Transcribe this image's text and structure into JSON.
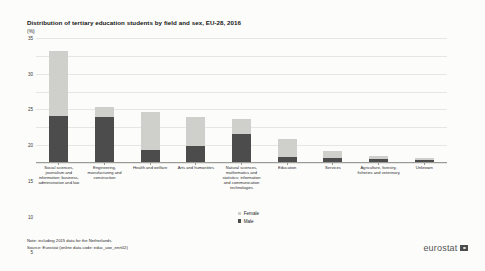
{
  "header": {
    "title": "Distribution of tertiary education students by field and sex, EU-28, 2016",
    "unit": "(%)"
  },
  "legend": {
    "female_label": "Female",
    "male_label": "Male"
  },
  "footer": {
    "note": "Note: including 2015 data for the Netherlands.",
    "source": "Source: Eurostat (online data code: educ_uoe_enrt02)",
    "brand": "eurostat"
  },
  "colors": {
    "female": "#cfcfcc",
    "male": "#4c4c4c",
    "grid": "#e6e6e3",
    "axis": "#9a9a97",
    "background": "#fcfcfb"
  },
  "chart_data": {
    "type": "bar",
    "title": "Distribution of tertiary education students by field and sex, EU-28, 2016",
    "xlabel": "",
    "ylabel": "(%)",
    "ylim": [
      0,
      35
    ],
    "yticks": [
      0,
      5,
      10,
      15,
      20,
      25,
      30,
      35
    ],
    "grid": true,
    "stacked": true,
    "legend_position": "bottom-center",
    "categories": [
      "Social sciences, journalism and information; business, administration and law",
      "Engineering, manufacturing and construction",
      "Health and welfare",
      "Arts and humanities",
      "Natural sciences, mathematics and statistics; information and communication technologies",
      "Education",
      "Services",
      "Agriculture, forestry, fisheries and veterinary",
      "Unknown"
    ],
    "series": [
      {
        "name": "Male",
        "values": [
          13.0,
          12.5,
          3.3,
          4.6,
          7.8,
          1.4,
          1.2,
          0.8,
          0.5
        ]
      },
      {
        "name": "Female",
        "values": [
          18.0,
          3.0,
          10.6,
          8.0,
          4.2,
          5.0,
          2.0,
          1.0,
          0.6
        ]
      }
    ],
    "totals": [
      31.0,
      15.5,
      13.9,
      12.6,
      12.0,
      6.4,
      3.2,
      1.8,
      1.1
    ]
  }
}
